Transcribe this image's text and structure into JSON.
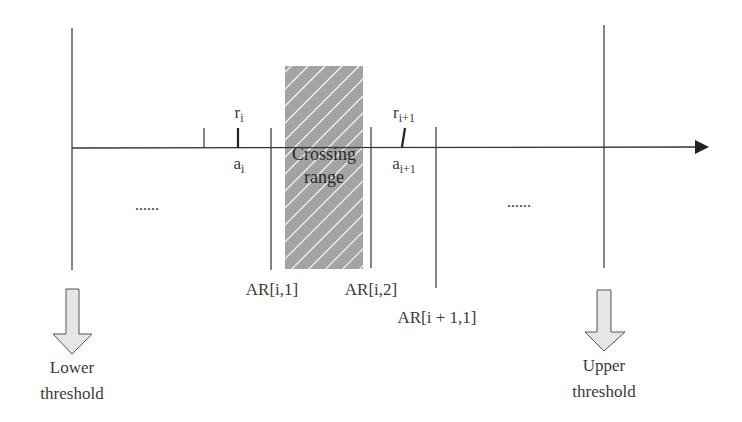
{
  "diagram": {
    "type": "number-line threshold ranges",
    "crossing_range": {
      "line1": "Crossing",
      "line2": "range",
      "fill": "#a3a3a3",
      "hatch_color": "#ffffff"
    },
    "points": [
      {
        "id": "r_i",
        "base": "r",
        "sub": "i"
      },
      {
        "id": "a_i",
        "base": "a",
        "sub": "i"
      },
      {
        "id": "r_i1",
        "base": "r",
        "sub": "i+1"
      },
      {
        "id": "a_i1",
        "base": "a",
        "sub": "i+1"
      }
    ],
    "boundaries": {
      "ar_i_1": "AR[i,1]",
      "ar_i_2": "AR[i,2]",
      "ar_i1_1": "AR[i + 1,1]"
    },
    "ellipsis_left": "......",
    "ellipsis_right": "......",
    "lower": {
      "line1": "Lower",
      "line2": "threshold"
    },
    "upper": {
      "line1": "Upper",
      "line2": "threshold"
    },
    "colors": {
      "line": "#333333",
      "arrow_fill": "#e6e6e6",
      "arrow_stroke": "#555555"
    }
  }
}
